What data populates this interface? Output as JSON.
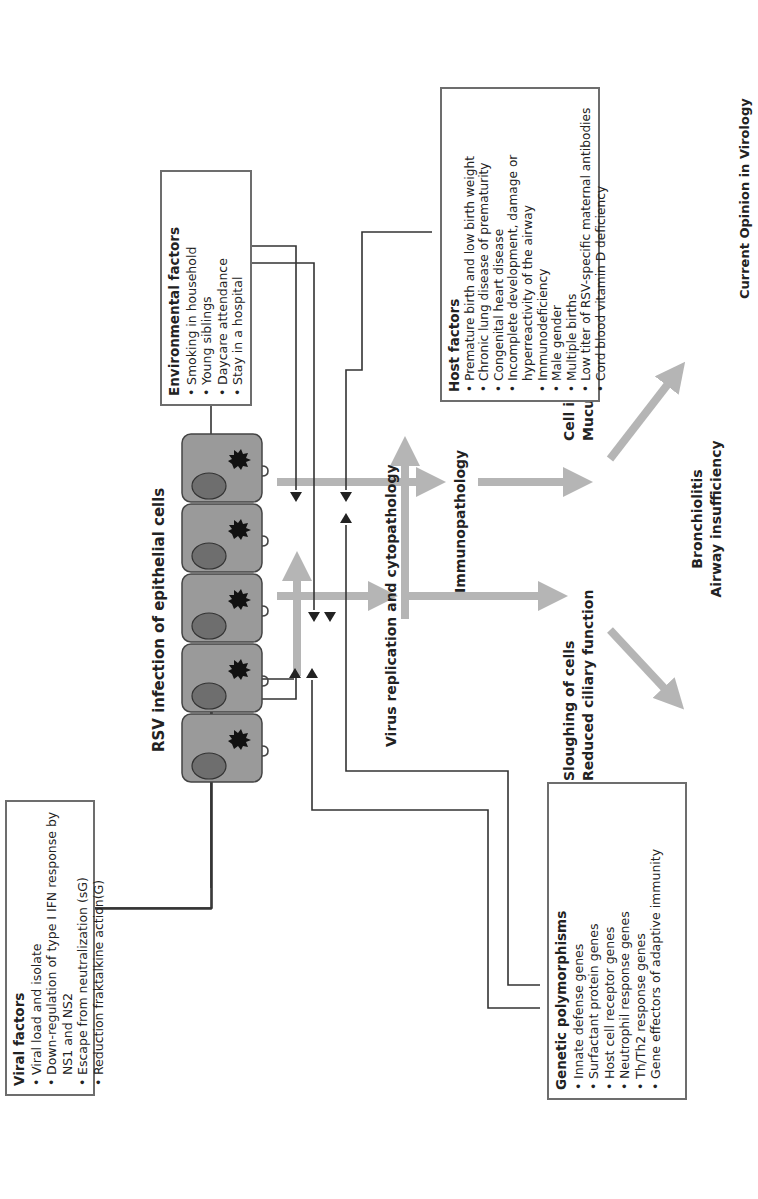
{
  "diagram": {
    "title": "RSV infection of epithelial cells",
    "central_flow": {
      "virus_replication": "Virus replication and cytopathology",
      "immunopathology": "Immunopathology",
      "outcome_left": [
        "Sloughing of cells",
        "Reduced ciliary function"
      ],
      "outcome_right": [
        "Cell infiltration",
        "Mucus production"
      ],
      "final": [
        "Bronchiolitis",
        "Airway insufficiency"
      ]
    },
    "boxes": {
      "viral_factors": {
        "title": "Viral factors",
        "items": [
          "Viral load and isolate",
          "Down-regulation of type I IFN response by NS1 and NS2",
          "Escape from neutralization (sG)",
          "Reduction fraktalkine action(G)"
        ]
      },
      "genetic_polymorphisms": {
        "title": "Genetic polymorphisms",
        "items": [
          "Innate defense genes",
          "Surfactant protein genes",
          "Host cell receptor genes",
          "Neutrophil response genes",
          "Th/Th2 response genes",
          "Gene effectors of adaptive immunity"
        ]
      },
      "environmental_factors": {
        "title": "Environmental factors",
        "items": [
          "Smoking in household",
          "Young siblings",
          "Daycare attendance",
          "Stay in a hospital"
        ]
      },
      "host_factors": {
        "title": "Host factors",
        "items": [
          "Premature birth and low birth weight",
          "Chronic lung disease of prematurity",
          "Congenital heart disease",
          "Incomplete development, damage or hyperreactivity of the airway",
          "Immunodeficiency",
          "Male gender",
          "Multiple births",
          "Low titer of RSV-specific maternal antibodies",
          "Cord blood vitamin D deficiency"
        ]
      }
    },
    "cell_count": 5,
    "colors": {
      "cell_fill": "#9a9a9a",
      "nucleus_fill": "#6e6e6e",
      "flow_arrow": "#b5b5b5",
      "connector": "#333333",
      "box_border": "#6d6d6d"
    },
    "source": "Current Opinion in Virology"
  }
}
